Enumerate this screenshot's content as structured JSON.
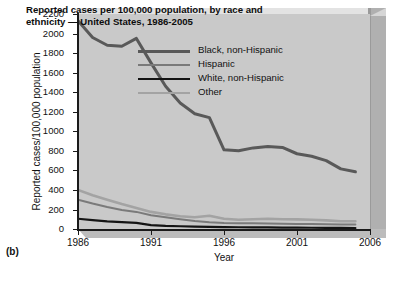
{
  "figure_label": "(b)",
  "chart_data": {
    "type": "line",
    "title": "Reported cases per 100,000 population, by race and ethnicity — United States, 1986-2005",
    "title_line1": "Reported cases per 100,000 population, by race and",
    "title_line2": "ethnicity — United States, 1986-2005",
    "xlabel": "Year",
    "ylabel": "Reported cases/100,000 population",
    "xlim": [
      1986,
      2006
    ],
    "ylim": [
      0,
      2200
    ],
    "xticks": [
      1986,
      1991,
      1996,
      2001,
      2006
    ],
    "xticklabels": [
      "1986",
      "1991",
      "1996",
      "2001",
      "2006"
    ],
    "yticks": [
      0,
      200,
      400,
      600,
      800,
      1000,
      1200,
      1400,
      1600,
      1800,
      2000,
      2200
    ],
    "yticklabels": [
      "0",
      "200",
      "400",
      "600",
      "800",
      "1000",
      "1200",
      "1400",
      "1600",
      "1800",
      "2000",
      "2200"
    ],
    "grid": false,
    "legend_position": "upper right",
    "x": [
      1986,
      1987,
      1988,
      1989,
      1990,
      1991,
      1992,
      1993,
      1994,
      1995,
      1996,
      1997,
      1998,
      1999,
      2000,
      2001,
      2002,
      2003,
      2004,
      2005
    ],
    "series": [
      {
        "name": "Black, non-Hispanic",
        "color": "#595959",
        "width": 3.0,
        "values": [
          2130,
          1960,
          1880,
          1870,
          1950,
          1700,
          1460,
          1290,
          1180,
          1140,
          810,
          800,
          830,
          845,
          835,
          770,
          745,
          700,
          615,
          585
        ]
      },
      {
        "name": "Hispanic",
        "color": "#7a7a7a",
        "width": 2.0,
        "values": [
          300,
          260,
          225,
          195,
          175,
          140,
          120,
          100,
          82,
          68,
          62,
          60,
          58,
          56,
          54,
          52,
          50,
          48,
          46,
          45
        ]
      },
      {
        "name": "White, non-Hispanic",
        "color": "#141414",
        "width": 2.2,
        "values": [
          105,
          90,
          78,
          70,
          62,
          40,
          32,
          28,
          24,
          21,
          19,
          18,
          17,
          16,
          15,
          14,
          13,
          12,
          11,
          10
        ]
      },
      {
        "name": "Other",
        "color": "#a3a3a3",
        "width": 2.6,
        "values": [
          400,
          345,
          300,
          255,
          215,
          175,
          150,
          130,
          120,
          135,
          105,
          95,
          100,
          105,
          100,
          98,
          95,
          88,
          80,
          80
        ]
      }
    ]
  }
}
